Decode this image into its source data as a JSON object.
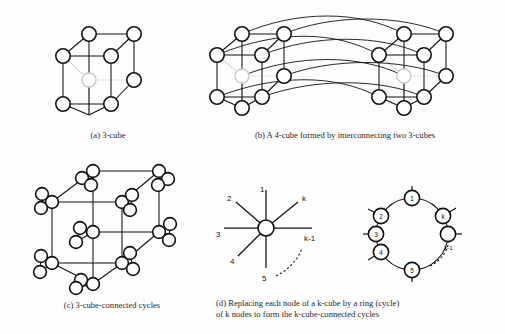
{
  "figure": {
    "background_color": "#fdfdfd",
    "ink_color": "#111111",
    "hidden_node_color": "#c9c9c9"
  },
  "panels": {
    "a": {
      "id": "(a)",
      "caption": "(a) 3-cube",
      "caption_text": "3-cube",
      "node_count": 8,
      "edge_count": 12,
      "hidden_nodes": 1
    },
    "b": {
      "id": "(b)",
      "caption": "(b) A 4-cube formed by interconnecting two 3-cubes",
      "caption_text": "A 4-cube formed by interconnecting two 3-cubes",
      "node_count": 16,
      "subcubes": 2,
      "connecting_arcs": 8
    },
    "c": {
      "id": "(c)",
      "caption": "(c) 3-cube-connected cycles",
      "caption_text": "3-cube-connected cycles",
      "node_count": 24,
      "rings": 8,
      "ring_size": 3
    },
    "d": {
      "id": "(d)",
      "caption_line1": "(d) Replacing each node of a k-cube by a ring (cycle)",
      "caption_line2": "of k nodes to form the k-cube-connected cycles",
      "caption_plain": "(d) Replacing each node of a k-cube by a ring (cycle) of k nodes to form the k-cube-connected cycles",
      "star": {
        "label": "degree-k node",
        "edge_labels": [
          "1",
          "2",
          "3",
          "4",
          "5",
          "k",
          "k-1"
        ]
      },
      "ring": {
        "label": "k-node ring",
        "node_labels": [
          "1",
          "2",
          "3",
          "4",
          "5",
          "k",
          "k-1"
        ],
        "ellipsis": "dotted arc"
      }
    }
  }
}
